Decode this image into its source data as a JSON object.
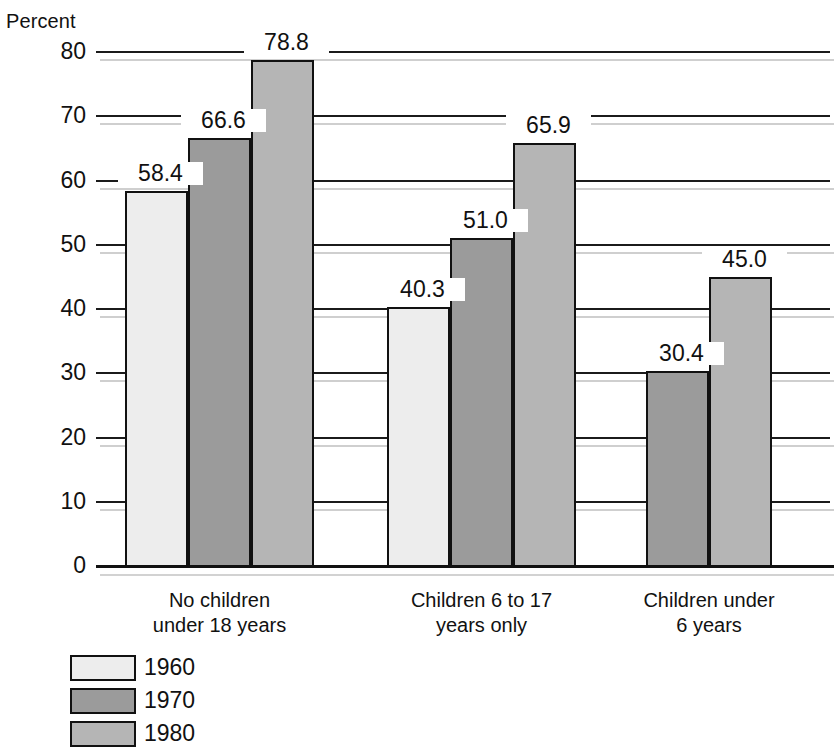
{
  "chart_data": {
    "type": "bar",
    "title": "",
    "ylabel": "Percent",
    "xlabel": "",
    "ylim": [
      0,
      80
    ],
    "yticks": [
      0,
      10,
      20,
      30,
      40,
      50,
      60,
      70,
      80
    ],
    "ytick_labels": [
      "0",
      "10",
      "20",
      "30",
      "40",
      "50",
      "60",
      "70",
      "80"
    ],
    "grid": true,
    "legend_position": "bottom-left",
    "categories": [
      "No children under 18 years",
      "Children 6 to 17 years only",
      "Children under 6 years"
    ],
    "series": [
      {
        "name": "1960",
        "values": [
          58.4,
          40.3,
          null
        ]
      },
      {
        "name": "1970",
        "values": [
          66.6,
          51.0,
          30.4
        ]
      },
      {
        "name": "1980",
        "values": [
          78.8,
          65.9,
          45.0
        ]
      }
    ]
  },
  "axis": {
    "y_title": "Percent",
    "ticks": [
      {
        "label": "80",
        "value": 80
      },
      {
        "label": "70",
        "value": 70
      },
      {
        "label": "60",
        "value": 60
      },
      {
        "label": "50",
        "value": 50
      },
      {
        "label": "40",
        "value": 40
      },
      {
        "label": "30",
        "value": 30
      },
      {
        "label": "20",
        "value": 20
      },
      {
        "label": "10",
        "value": 10
      },
      {
        "label": "0",
        "value": 0
      }
    ]
  },
  "groups": [
    {
      "label_line1": "No children",
      "label_line2": "under 18 years",
      "bars": [
        {
          "series": "1960",
          "value": 58.4,
          "value_label": "58.4"
        },
        {
          "series": "1970",
          "value": 66.6,
          "value_label": "66.6"
        },
        {
          "series": "1980",
          "value": 78.8,
          "value_label": "78.8"
        }
      ]
    },
    {
      "label_line1": "Children 6 to 17",
      "label_line2": "years only",
      "bars": [
        {
          "series": "1960",
          "value": 40.3,
          "value_label": "40.3"
        },
        {
          "series": "1970",
          "value": 51.0,
          "value_label": "51.0"
        },
        {
          "series": "1980",
          "value": 65.9,
          "value_label": "65.9"
        }
      ]
    },
    {
      "label_line1": "Children under",
      "label_line2": "6 years",
      "bars": [
        {
          "series": "1970",
          "value": 30.4,
          "value_label": "30.4"
        },
        {
          "series": "1980",
          "value": 45.0,
          "value_label": "45.0"
        }
      ]
    }
  ],
  "legend": {
    "items": [
      {
        "label": "1960",
        "color": "#ededed"
      },
      {
        "label": "1970",
        "color": "#9b9b9b"
      },
      {
        "label": "1980",
        "color": "#b5b5b5"
      }
    ]
  },
  "colors": {
    "series_1960": "#ededed",
    "series_1970": "#9b9b9b",
    "series_1980": "#b5b5b5",
    "outline": "#111111",
    "gridline": "#1b1b1b",
    "gridline_shadow": "#cfcfcf",
    "background": "#ffffff"
  }
}
